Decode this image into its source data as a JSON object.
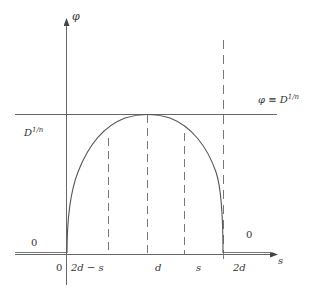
{
  "diagram": {
    "axes": {
      "x_label": "s",
      "y_label": "φ"
    },
    "labels": {
      "level_left": "D",
      "level_left_exp": "1/n",
      "level_right_eq": "φ ≡ D",
      "level_right_exp": "1/n",
      "zero_left": "0",
      "zero_right": "0"
    },
    "ticks": [
      {
        "label": "0"
      },
      {
        "label": "2d − s"
      },
      {
        "label": "d"
      },
      {
        "label": "s"
      },
      {
        "label": "2d"
      }
    ],
    "colors": {
      "line": "#555555",
      "curve": "#555555",
      "text": "#333333"
    }
  }
}
